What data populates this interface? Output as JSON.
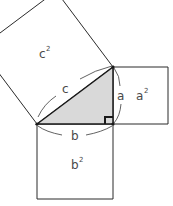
{
  "diagram": {
    "colors": {
      "stroke": "#2a2a2a",
      "triangle_fill": "#d9d9d9",
      "label": "#4a4a4a",
      "arc": "#3a3a3a"
    },
    "triangle": {
      "vertices": [
        [
          37,
          124
        ],
        [
          113,
          67
        ],
        [
          113,
          124
        ]
      ],
      "right_angle_at": [
        113,
        124
      ]
    },
    "squares": {
      "c2": {
        "label": "c",
        "exp": "2",
        "points": [
          [
            37,
            124
          ],
          [
            113,
            67
          ],
          [
            56,
            -9
          ],
          [
            -20,
            48
          ]
        ]
      },
      "a2": {
        "label": "a",
        "exp": "2",
        "points": [
          [
            113,
            67
          ],
          [
            168,
            67
          ],
          [
            168,
            124
          ],
          [
            113,
            124
          ]
        ]
      },
      "b2": {
        "label": "b",
        "exp": "2",
        "points": [
          [
            37,
            124
          ],
          [
            113,
            124
          ],
          [
            113,
            199
          ],
          [
            37,
            199
          ]
        ]
      }
    },
    "side_labels": {
      "a": "a",
      "b": "b",
      "c": "c"
    }
  }
}
